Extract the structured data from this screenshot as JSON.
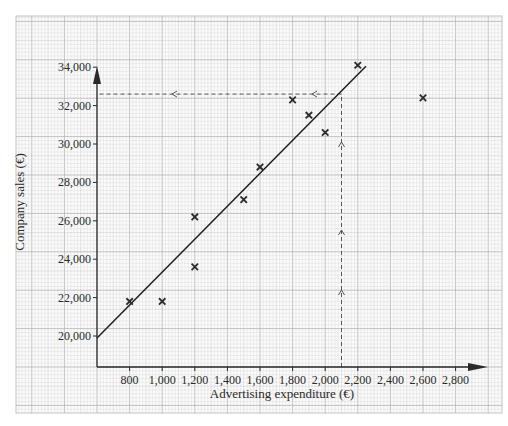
{
  "chart_data": {
    "type": "scatter",
    "title": "",
    "xlabel": "Advertising expenditure (€)",
    "ylabel": "Company sales (€)",
    "xlim": [
      600,
      2900
    ],
    "ylim": [
      19400,
      35300
    ],
    "grid": true,
    "legend": null,
    "x_ticks": [
      800,
      1000,
      1200,
      1400,
      1600,
      1800,
      2000,
      2200,
      2400,
      2600,
      2800
    ],
    "x_tick_labels": [
      "800",
      "1,000",
      "1,200",
      "1,400",
      "1,600",
      "1,800",
      "2,000",
      "2,200",
      "2,400",
      "2,600",
      "2,800"
    ],
    "y_ticks": [
      20000,
      22000,
      24000,
      26000,
      28000,
      30000,
      32000,
      34000
    ],
    "y_tick_labels": [
      "20,000",
      "22,000",
      "24,000",
      "26,000",
      "28,000",
      "30,000",
      "32,000",
      "34,000"
    ],
    "series": [
      {
        "name": "Observations",
        "marker": "x",
        "points": [
          {
            "x": 800,
            "y": 21800
          },
          {
            "x": 1000,
            "y": 21800
          },
          {
            "x": 1200,
            "y": 26200
          },
          {
            "x": 1200,
            "y": 23600
          },
          {
            "x": 1500,
            "y": 27100
          },
          {
            "x": 1600,
            "y": 28800
          },
          {
            "x": 1800,
            "y": 32300
          },
          {
            "x": 1900,
            "y": 31500
          },
          {
            "x": 2000,
            "y": 30600
          },
          {
            "x": 2200,
            "y": 34100
          },
          {
            "x": 2600,
            "y": 32400
          }
        ]
      }
    ],
    "line_of_best_fit": {
      "start": {
        "x": 600,
        "y": 19900
      },
      "end": {
        "x": 2250,
        "y": 34050
      }
    },
    "annotations": {
      "estimate_x": 2100,
      "estimate_y": 32600,
      "description": "Dashed lines read from x = 2,100 up to the fit line and across to y ≈ 32,600"
    }
  },
  "colors": {
    "grid_minor": "#dcdcdc",
    "grid_major": "#b4b4b4",
    "axis": "#2a2a2a",
    "line": "#1e1e1e",
    "marker": "#2a2a2a",
    "dashed": "#555555"
  }
}
